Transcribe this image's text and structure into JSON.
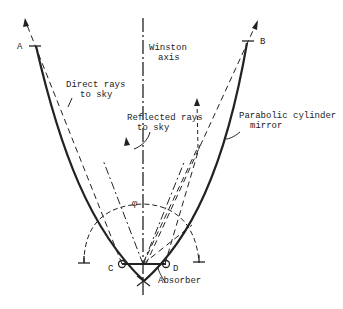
{
  "diagram": {
    "labels": {
      "point_a": "A",
      "point_b": "B",
      "point_c": "C",
      "point_d": "D",
      "axis_line1": "Winston",
      "axis_line2": "axis",
      "direct_line1": "Direct rays",
      "direct_line2": "to sky",
      "reflected_line1": "Reflected rays",
      "reflected_line2": "to sky",
      "mirror_line1": "Parabolic cylinder",
      "mirror_line2": "mirror",
      "absorber": "Absorber",
      "angle": "φ"
    },
    "colors": {
      "line": "#222222",
      "background": "#ffffff"
    }
  }
}
